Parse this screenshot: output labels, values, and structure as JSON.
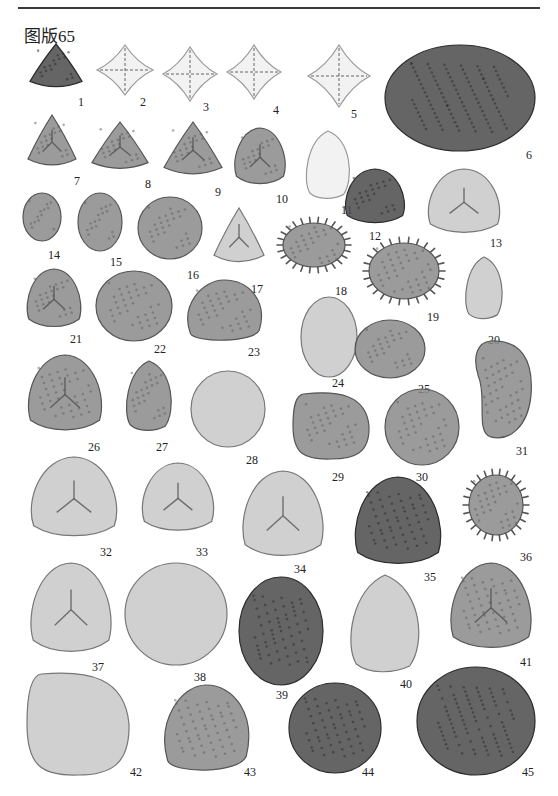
{
  "page": {
    "header_text": "",
    "plate_title": "图版65"
  },
  "colors": {
    "background": "#ffffff",
    "rule": "#3a3a3a",
    "specimen_dark": "#4a4a4a",
    "specimen_mid": "#8a8a8a",
    "specimen_light": "#c8c8c8",
    "specimen_pale": "#e8e8e8"
  },
  "figures": [
    {
      "n": "1",
      "label": "1",
      "shape": "triangle",
      "tone": "dark",
      "x": 28,
      "y": 42,
      "w": 56,
      "h": 48,
      "lx": 78,
      "ly": 95
    },
    {
      "n": "2",
      "label": "2",
      "shape": "diamond",
      "tone": "pale",
      "x": 96,
      "y": 44,
      "w": 58,
      "h": 52,
      "lx": 140,
      "ly": 95
    },
    {
      "n": "3",
      "label": "3",
      "shape": "diamond",
      "tone": "pale",
      "x": 162,
      "y": 46,
      "w": 56,
      "h": 56,
      "lx": 203,
      "ly": 100
    },
    {
      "n": "4",
      "label": "4",
      "shape": "diamond",
      "tone": "pale",
      "x": 226,
      "y": 44,
      "w": 56,
      "h": 56,
      "lx": 273,
      "ly": 103
    },
    {
      "n": "5",
      "label": "5",
      "shape": "diamond",
      "tone": "pale",
      "x": 307,
      "y": 44,
      "w": 64,
      "h": 64,
      "lx": 351,
      "ly": 107
    },
    {
      "n": "6",
      "label": "6",
      "shape": "oval",
      "tone": "dark",
      "x": 384,
      "y": 44,
      "w": 152,
      "h": 108,
      "lx": 526,
      "ly": 148
    },
    {
      "n": "7",
      "label": "7",
      "shape": "triangle",
      "tone": "mid",
      "x": 26,
      "y": 113,
      "w": 52,
      "h": 56,
      "lx": 74,
      "ly": 174
    },
    {
      "n": "8",
      "label": "8",
      "shape": "triangle",
      "tone": "mid",
      "x": 90,
      "y": 120,
      "w": 60,
      "h": 52,
      "lx": 145,
      "ly": 177
    },
    {
      "n": "9",
      "label": "9",
      "shape": "triangle",
      "tone": "mid",
      "x": 162,
      "y": 120,
      "w": 62,
      "h": 58,
      "lx": 215,
      "ly": 185
    },
    {
      "n": "10",
      "label": "10",
      "shape": "roundtri",
      "tone": "mid",
      "x": 232,
      "y": 127,
      "w": 56,
      "h": 58,
      "lx": 276,
      "ly": 192
    },
    {
      "n": "11",
      "label": "11",
      "shape": "drop",
      "tone": "pale",
      "x": 302,
      "y": 130,
      "w": 52,
      "h": 70,
      "lx": 341,
      "ly": 203
    },
    {
      "n": "12",
      "label": "12",
      "shape": "roundtri",
      "tone": "dark",
      "x": 342,
      "y": 168,
      "w": 66,
      "h": 56,
      "lx": 369,
      "ly": 229
    },
    {
      "n": "13",
      "label": "13",
      "shape": "roundtri",
      "tone": "light",
      "x": 424,
      "y": 168,
      "w": 80,
      "h": 66,
      "lx": 490,
      "ly": 236
    },
    {
      "n": "14",
      "label": "14",
      "shape": "oval",
      "tone": "mid",
      "x": 22,
      "y": 192,
      "w": 40,
      "h": 50,
      "lx": 48,
      "ly": 248
    },
    {
      "n": "15",
      "label": "15",
      "shape": "oval",
      "tone": "mid",
      "x": 77,
      "y": 192,
      "w": 46,
      "h": 60,
      "lx": 110,
      "ly": 255
    },
    {
      "n": "16",
      "label": "16",
      "shape": "oval",
      "tone": "mid",
      "x": 137,
      "y": 196,
      "w": 66,
      "h": 64,
      "lx": 187,
      "ly": 268
    },
    {
      "n": "17",
      "label": "17",
      "shape": "triangle",
      "tone": "light",
      "x": 212,
      "y": 206,
      "w": 54,
      "h": 60,
      "lx": 251,
      "ly": 282
    },
    {
      "n": "18",
      "label": "18",
      "shape": "spiny",
      "tone": "mid",
      "x": 276,
      "y": 216,
      "w": 76,
      "h": 58,
      "lx": 335,
      "ly": 284
    },
    {
      "n": "19",
      "label": "19",
      "shape": "spiny",
      "tone": "mid",
      "x": 362,
      "y": 236,
      "w": 84,
      "h": 70,
      "lx": 427,
      "ly": 310
    },
    {
      "n": "20",
      "label": "20",
      "shape": "drop",
      "tone": "light",
      "x": 462,
      "y": 256,
      "w": 44,
      "h": 64,
      "lx": 488,
      "ly": 333
    },
    {
      "n": "21",
      "label": "21",
      "shape": "roundtri",
      "tone": "mid",
      "x": 24,
      "y": 268,
      "w": 60,
      "h": 60,
      "lx": 70,
      "ly": 332
    },
    {
      "n": "22",
      "label": "22",
      "shape": "oval",
      "tone": "mid",
      "x": 95,
      "y": 270,
      "w": 78,
      "h": 72,
      "lx": 154,
      "ly": 342
    },
    {
      "n": "23",
      "label": "23",
      "shape": "halfoval",
      "tone": "mid",
      "x": 182,
      "y": 279,
      "w": 84,
      "h": 64,
      "lx": 248,
      "ly": 345
    },
    {
      "n": "24",
      "label": "24",
      "shape": "oval",
      "tone": "light",
      "x": 300,
      "y": 296,
      "w": 58,
      "h": 82,
      "lx": 332,
      "ly": 376
    },
    {
      "n": "25",
      "label": "25",
      "shape": "oval",
      "tone": "mid",
      "x": 354,
      "y": 319,
      "w": 72,
      "h": 60,
      "lx": 418,
      "ly": 382
    },
    {
      "n": "26",
      "label": "26",
      "shape": "roundtri",
      "tone": "mid",
      "x": 24,
      "y": 354,
      "w": 82,
      "h": 78,
      "lx": 88,
      "ly": 440
    },
    {
      "n": "27",
      "label": "27",
      "shape": "drop",
      "tone": "mid",
      "x": 122,
      "y": 360,
      "w": 54,
      "h": 72,
      "lx": 156,
      "ly": 440
    },
    {
      "n": "28",
      "label": "28",
      "shape": "oval",
      "tone": "light",
      "x": 190,
      "y": 370,
      "w": 76,
      "h": 78,
      "lx": 246,
      "ly": 453
    },
    {
      "n": "29",
      "label": "29",
      "shape": "roundsq",
      "tone": "mid",
      "x": 292,
      "y": 392,
      "w": 78,
      "h": 68,
      "lx": 332,
      "ly": 470
    },
    {
      "n": "30",
      "label": "30",
      "shape": "oval",
      "tone": "mid",
      "x": 384,
      "y": 388,
      "w": 76,
      "h": 78,
      "lx": 416,
      "ly": 470
    },
    {
      "n": "31",
      "label": "31",
      "shape": "kidney",
      "tone": "mid",
      "x": 472,
      "y": 340,
      "w": 62,
      "h": 102,
      "lx": 516,
      "ly": 444
    },
    {
      "n": "32",
      "label": "32",
      "shape": "roundtri",
      "tone": "light",
      "x": 26,
      "y": 456,
      "w": 96,
      "h": 82,
      "lx": 100,
      "ly": 545
    },
    {
      "n": "33",
      "label": "33",
      "shape": "roundtri",
      "tone": "light",
      "x": 138,
      "y": 462,
      "w": 80,
      "h": 70,
      "lx": 196,
      "ly": 545
    },
    {
      "n": "34",
      "label": "34",
      "shape": "roundtri",
      "tone": "light",
      "x": 238,
      "y": 470,
      "w": 90,
      "h": 88,
      "lx": 294,
      "ly": 562
    },
    {
      "n": "35",
      "label": "35",
      "shape": "roundtri",
      "tone": "dark",
      "x": 350,
      "y": 476,
      "w": 96,
      "h": 90,
      "lx": 424,
      "ly": 570
    },
    {
      "n": "36",
      "label": "36",
      "shape": "spiny",
      "tone": "mid",
      "x": 462,
      "y": 468,
      "w": 68,
      "h": 74,
      "lx": 520,
      "ly": 550
    },
    {
      "n": "37",
      "label": "37",
      "shape": "roundtri",
      "tone": "light",
      "x": 26,
      "y": 562,
      "w": 90,
      "h": 92,
      "lx": 92,
      "ly": 660
    },
    {
      "n": "38",
      "label": "38",
      "shape": "oval",
      "tone": "light",
      "x": 124,
      "y": 562,
      "w": 104,
      "h": 104,
      "lx": 194,
      "ly": 670
    },
    {
      "n": "39",
      "label": "39",
      "shape": "oval",
      "tone": "dark",
      "x": 238,
      "y": 576,
      "w": 86,
      "h": 110,
      "lx": 276,
      "ly": 688
    },
    {
      "n": "40",
      "label": "40",
      "shape": "drop",
      "tone": "light",
      "x": 344,
      "y": 574,
      "w": 82,
      "h": 100,
      "lx": 400,
      "ly": 677
    },
    {
      "n": "41",
      "label": "41",
      "shape": "roundtri",
      "tone": "mid",
      "x": 446,
      "y": 562,
      "w": 90,
      "h": 88,
      "lx": 520,
      "ly": 655
    },
    {
      "n": "42",
      "label": "42",
      "shape": "roundsq",
      "tone": "light",
      "x": 26,
      "y": 672,
      "w": 104,
      "h": 104,
      "lx": 130,
      "ly": 765
    },
    {
      "n": "43",
      "label": "43",
      "shape": "halfoval",
      "tone": "mid",
      "x": 158,
      "y": 684,
      "w": 96,
      "h": 90,
      "lx": 244,
      "ly": 765
    },
    {
      "n": "44",
      "label": "44",
      "shape": "oval",
      "tone": "dark",
      "x": 288,
      "y": 682,
      "w": 94,
      "h": 92,
      "lx": 362,
      "ly": 765
    },
    {
      "n": "45",
      "label": "45",
      "shape": "oval",
      "tone": "dark",
      "x": 416,
      "y": 666,
      "w": 120,
      "h": 110,
      "lx": 522,
      "ly": 765
    }
  ]
}
